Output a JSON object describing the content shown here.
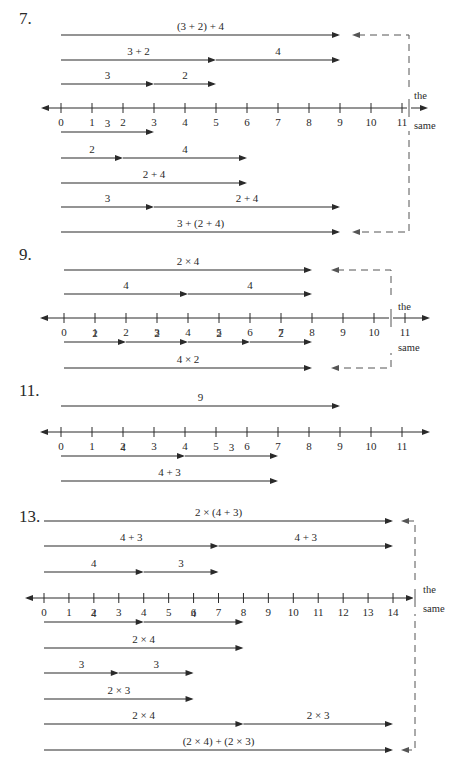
{
  "problems": [
    {
      "number": "7.",
      "number_pos": [
        19,
        9
      ],
      "origin_x": 61,
      "unit": 31,
      "axis_y": 108,
      "axis_min": 0,
      "axis_max": 11,
      "axis_left_x": 43,
      "axis_right_x": 425,
      "rows": [
        {
          "y": 35,
          "segments": [
            {
              "from": 0,
              "to": 9,
              "label": "(3 + 2) + 4"
            }
          ]
        },
        {
          "y": 60,
          "segments": [
            {
              "from": 0,
              "to": 5,
              "label": "3 + 2"
            },
            {
              "from": 5,
              "to": 9,
              "label": "4"
            }
          ]
        },
        {
          "y": 84,
          "segments": [
            {
              "from": 0,
              "to": 3,
              "label": "3"
            },
            {
              "from": 3,
              "to": 5,
              "label": "2"
            }
          ]
        },
        {
          "y": 132,
          "segments": [
            {
              "from": 0,
              "to": 3,
              "label": "3"
            }
          ]
        },
        {
          "y": 158,
          "segments": [
            {
              "from": 0,
              "to": 2,
              "label": "2"
            },
            {
              "from": 2,
              "to": 6,
              "label": "4"
            }
          ]
        },
        {
          "y": 183,
          "segments": [
            {
              "from": 0,
              "to": 6,
              "label": "2 + 4"
            }
          ]
        },
        {
          "y": 207,
          "segments": [
            {
              "from": 0,
              "to": 3,
              "label": "3"
            },
            {
              "from": 3,
              "to": 9,
              "label": "2 + 4"
            }
          ]
        },
        {
          "y": 232,
          "segments": [
            {
              "from": 0,
              "to": 9,
              "label": "3 + (2 + 4)"
            }
          ]
        }
      ],
      "bracket": {
        "x": 409,
        "top_y": 35,
        "bottom_y": 232,
        "arrow_tip_x": 352,
        "label_top": "the",
        "label_bottom": "same",
        "label_x": 414,
        "label_top_y": 99,
        "label_bottom_y": 129
      }
    },
    {
      "number": "9.",
      "number_pos": [
        19,
        245
      ],
      "origin_x": 64,
      "unit": 31,
      "axis_y": 318,
      "axis_min": 0,
      "axis_max": 11,
      "axis_left_x": 42,
      "axis_right_x": 427,
      "rows": [
        {
          "y": 270,
          "segments": [
            {
              "from": 0,
              "to": 8,
              "label": "2 × 4"
            }
          ]
        },
        {
          "y": 294,
          "segments": [
            {
              "from": 0,
              "to": 4,
              "label": "4"
            },
            {
              "from": 4,
              "to": 8,
              "label": "4"
            }
          ]
        },
        {
          "y": 342,
          "segments": [
            {
              "from": 0,
              "to": 2,
              "label": "2"
            },
            {
              "from": 2,
              "to": 4,
              "label": "2"
            },
            {
              "from": 4,
              "to": 6,
              "label": "2"
            },
            {
              "from": 6,
              "to": 8,
              "label": "2"
            }
          ]
        },
        {
          "y": 368,
          "segments": [
            {
              "from": 0,
              "to": 8,
              "label": "4 × 2"
            }
          ]
        }
      ],
      "bracket": {
        "x": 391,
        "top_y": 270,
        "bottom_y": 368,
        "arrow_tip_x": 331,
        "label_top": "the",
        "label_bottom": "same",
        "label_x": 398,
        "label_top_y": 310,
        "label_bottom_y": 351
      }
    },
    {
      "number": "11.",
      "number_pos": [
        19,
        381
      ],
      "origin_x": 61,
      "unit": 31,
      "axis_y": 432,
      "axis_min": 0,
      "axis_max": 11,
      "axis_left_x": 42,
      "axis_right_x": 427,
      "rows": [
        {
          "y": 406,
          "segments": [
            {
              "from": 0,
              "to": 9,
              "label": "9"
            }
          ]
        },
        {
          "y": 456,
          "segments": [
            {
              "from": 0,
              "to": 4,
              "label": "4"
            },
            {
              "from": 4,
              "to": 7,
              "label": "3"
            }
          ]
        },
        {
          "y": 481,
          "segments": [
            {
              "from": 0,
              "to": 7,
              "label": "4 + 3"
            }
          ]
        }
      ],
      "bracket": null
    },
    {
      "number": "13.",
      "number_pos": [
        19,
        507
      ],
      "origin_x": 44,
      "unit": 24.93,
      "axis_y": 598,
      "axis_min": 0,
      "axis_max": 14,
      "axis_left_x": 27,
      "axis_right_x": 411,
      "rows": [
        {
          "y": 521,
          "segments": [
            {
              "from": 0,
              "to": 14,
              "label": "2 × (4 + 3)"
            }
          ]
        },
        {
          "y": 546,
          "segments": [
            {
              "from": 0,
              "to": 7,
              "label": "4 + 3"
            },
            {
              "from": 7,
              "to": 14,
              "label": "4 + 3"
            }
          ]
        },
        {
          "y": 572,
          "segments": [
            {
              "from": 0,
              "to": 4,
              "label": "4"
            },
            {
              "from": 4,
              "to": 7,
              "label": "3"
            }
          ]
        },
        {
          "y": 622,
          "segments": [
            {
              "from": 0,
              "to": 4,
              "label": "4"
            },
            {
              "from": 4,
              "to": 8,
              "label": "4"
            }
          ]
        },
        {
          "y": 648,
          "segments": [
            {
              "from": 0,
              "to": 8,
              "label": "2 × 4"
            }
          ]
        },
        {
          "y": 673,
          "segments": [
            {
              "from": 0,
              "to": 3,
              "label": "3"
            },
            {
              "from": 3,
              "to": 6,
              "label": "3"
            }
          ]
        },
        {
          "y": 699,
          "segments": [
            {
              "from": 0,
              "to": 6,
              "label": "2 × 3"
            }
          ]
        },
        {
          "y": 724,
          "segments": [
            {
              "from": 0,
              "to": 8,
              "label": "2 × 4"
            },
            {
              "from": 8,
              "to": 14,
              "label": "2 × 3"
            }
          ]
        },
        {
          "y": 750,
          "segments": [
            {
              "from": 0,
              "to": 14,
              "label": "(2 × 4) + (2 × 3)"
            }
          ]
        }
      ],
      "bracket": {
        "x": 415,
        "top_y": 521,
        "bottom_y": 750,
        "arrow_tip_x": 401,
        "label_top": "the",
        "label_bottom": "same",
        "label_x": 423,
        "label_top_y": 593,
        "label_bottom_y": 612
      }
    }
  ],
  "colors": {
    "ink": "#2a2a2a",
    "dash": "#555555"
  }
}
